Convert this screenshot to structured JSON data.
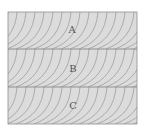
{
  "diagram": {
    "layers": [
      {
        "label": "A",
        "top": 12,
        "bottom": 49
      },
      {
        "label": "B",
        "top": 49,
        "bottom": 87
      },
      {
        "label": "C",
        "top": 87,
        "bottom": 124
      }
    ],
    "frame": {
      "left": 8,
      "right": 137
    },
    "colors": {
      "fill": "#dcdcdc",
      "line": "#8a8a8a",
      "border": "#909090"
    }
  }
}
